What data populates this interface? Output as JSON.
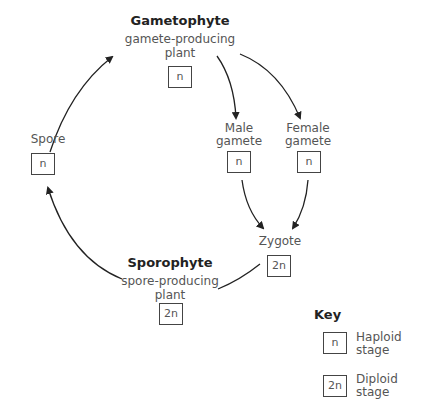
{
  "nodes": {
    "gametophyte": {
      "title": "Gametophyte",
      "line1": "gamete-producing",
      "line2": "plant",
      "ploidy": "n"
    },
    "spore": {
      "label": "Spore",
      "ploidy": "n"
    },
    "male_gamete": {
      "line1": "Male",
      "line2": "gamete",
      "ploidy": "n"
    },
    "female_gamete": {
      "line1": "Female",
      "line2": "gamete",
      "ploidy": "n"
    },
    "zygote": {
      "label": "Zygote",
      "ploidy": "2n"
    },
    "sporophyte": {
      "title": "Sporophyte",
      "line1": "spore-producing",
      "line2": "plant",
      "ploidy": "2n"
    }
  },
  "key": {
    "title": "Key",
    "items": [
      {
        "symbol": "n",
        "line1": "Haploid",
        "line2": "stage"
      },
      {
        "symbol": "2n",
        "line1": "Diploid",
        "line2": "stage"
      }
    ]
  },
  "colors": {
    "stroke": "#222222",
    "text": "#555555",
    "title": "#222222"
  }
}
